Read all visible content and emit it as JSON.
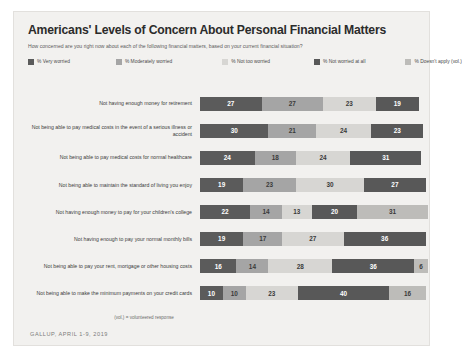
{
  "header": {
    "title": "Americans' Levels of Concern About Personal Financial Matters",
    "subtitle": "How concerned are you right now about each of the following financial matters, based on your current financial situation?"
  },
  "footer": {
    "vol_note": "(vol.) = volunteered response",
    "source": "GALLUP, APRIL 1-9, 2019"
  },
  "chart_data": {
    "type": "bar",
    "subtype": "stacked-horizontal-bar",
    "title": "Americans' Levels of Concern About Personal Financial Matters",
    "subtitle": "How concerned are you right now about each of the following financial matters, based on your current financial situation?",
    "xlabel": "",
    "ylabel": "",
    "xlim": [
      0,
      100
    ],
    "grid": false,
    "legend_position": "top",
    "value_unit": "%",
    "categories": [
      "Not having enough money for retirement",
      "Not being able to pay medical costs in the event of a serious illness or accident",
      "Not being able to pay medical costs for normal healthcare",
      "Not being able to maintain the standard of living you enjoy",
      "Not having enough money to pay for your children's college",
      "Not having enough to pay your normal monthly bills",
      "Not being able to pay your rent, mortgage or other housing costs",
      "Not being able to make the minimum payments on your credit cards"
    ],
    "series": [
      {
        "name": "% Very worried",
        "color": "#5b5b5b",
        "values": [
          27,
          30,
          24,
          19,
          22,
          19,
          16,
          10
        ]
      },
      {
        "name": "% Moderately worried",
        "color": "#a5a5a5",
        "values": [
          27,
          21,
          18,
          23,
          14,
          17,
          14,
          10
        ]
      },
      {
        "name": "% Not too worried",
        "color": "#d7d6d3",
        "values": [
          23,
          24,
          24,
          30,
          13,
          27,
          28,
          23
        ]
      },
      {
        "name": "% Not worried at all",
        "color": "#585858",
        "values": [
          19,
          23,
          31,
          27,
          20,
          36,
          36,
          40
        ]
      },
      {
        "name": "% Doesn't apply (vol.)",
        "color": "#bdbcb9",
        "values": [
          0,
          0,
          0,
          0,
          31,
          0,
          6,
          16
        ]
      }
    ]
  }
}
